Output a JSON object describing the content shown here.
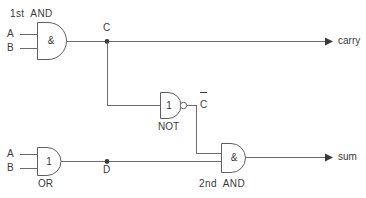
{
  "diagram": {
    "background_color": "#ffffff",
    "line_color": "#6b6b6b",
    "text_color": "#3a3a3a"
  },
  "labels": {
    "first_and_title": "1st  AND",
    "second_and_title": "2nd  AND",
    "not_title": "NOT",
    "or_title": "OR"
  },
  "gates": {
    "and1": {
      "name": "1st AND",
      "symbol": "&",
      "inputs": [
        "A",
        "B"
      ],
      "output_node": "C"
    },
    "or1": {
      "name": "OR",
      "symbol": "1",
      "inputs": [
        "A",
        "B"
      ],
      "output_node": "D"
    },
    "not1": {
      "name": "NOT",
      "symbol": "1",
      "inverted": true,
      "output_label": "C",
      "output_label_overbar": true
    },
    "and2": {
      "name": "2nd AND",
      "symbol": "&",
      "inputs": [
        "C-bar",
        "D"
      ],
      "output_node": "sum"
    }
  },
  "pins": {
    "and1_a": "A",
    "and1_b": "B",
    "or_a": "A",
    "or_b": "B"
  },
  "nodes": {
    "c": "C",
    "d": "D",
    "c_bar": "C"
  },
  "outputs": {
    "carry": "carry",
    "sum": "sum"
  }
}
